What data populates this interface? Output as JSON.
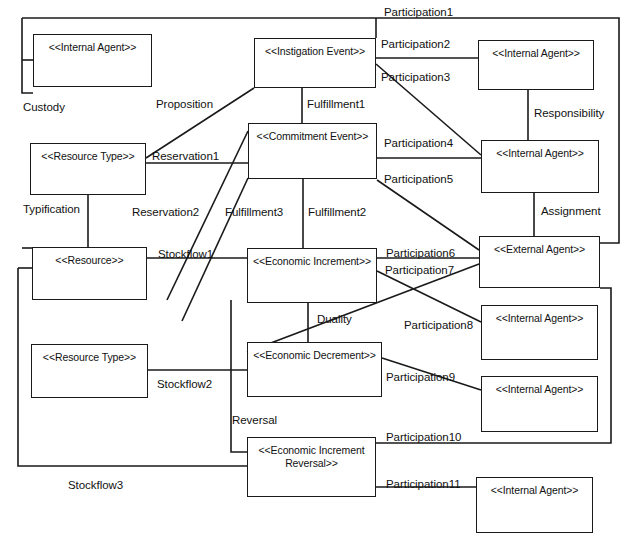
{
  "diagram": {
    "width": 638,
    "height": 548,
    "background": "#ffffff",
    "stroke": "#1a1a1a",
    "text_color": "#111111",
    "nodes": [
      {
        "id": "internal_agent_1",
        "label": "<<Internal Agent>>",
        "x": 33,
        "y": 34,
        "w": 119,
        "h": 53
      },
      {
        "id": "instigation_event",
        "label": "<<Instigation Event>>",
        "x": 254,
        "y": 38,
        "w": 122,
        "h": 50
      },
      {
        "id": "internal_agent_2",
        "label": "<<Internal Agent>>",
        "x": 478,
        "y": 40,
        "w": 116,
        "h": 50
      },
      {
        "id": "commitment_event",
        "label": "<<Commitment Event>>",
        "x": 248,
        "y": 123,
        "w": 129,
        "h": 56
      },
      {
        "id": "resource_type_1",
        "label": "<<Resource Type>>",
        "x": 30,
        "y": 143,
        "w": 116,
        "h": 52
      },
      {
        "id": "internal_agent_3",
        "label": "<<Internal Agent>>",
        "x": 481,
        "y": 140,
        "w": 118,
        "h": 53
      },
      {
        "id": "resource",
        "label": "<<Resource>>",
        "x": 32,
        "y": 247,
        "w": 115,
        "h": 53
      },
      {
        "id": "economic_increment",
        "label": "<<Economic Increment>>",
        "x": 247,
        "y": 248,
        "w": 130,
        "h": 55
      },
      {
        "id": "external_agent",
        "label": "<<External Agent>>",
        "x": 479,
        "y": 236,
        "w": 121,
        "h": 52
      },
      {
        "id": "internal_agent_4",
        "label": "<<Internal Agent>>",
        "x": 481,
        "y": 305,
        "w": 117,
        "h": 55
      },
      {
        "id": "resource_type_2",
        "label": "<<Resource Type>>",
        "x": 31,
        "y": 344,
        "w": 117,
        "h": 54
      },
      {
        "id": "economic_decrement",
        "label": "<<Economic Decrement>>",
        "x": 247,
        "y": 342,
        "w": 135,
        "h": 55
      },
      {
        "id": "internal_agent_5",
        "label": "<<Internal Agent>>",
        "x": 481,
        "y": 376,
        "w": 117,
        "h": 56
      },
      {
        "id": "economic_increment_reversal",
        "label": "<<Economic Increment\nReversal>>",
        "x": 247,
        "y": 437,
        "w": 129,
        "h": 60
      },
      {
        "id": "internal_agent_6",
        "label": "<<Internal Agent>>",
        "x": 476,
        "y": 477,
        "w": 117,
        "h": 56
      }
    ],
    "edge_labels": [
      {
        "id": "participation1",
        "text": "Participation1",
        "x": 384,
        "y": 6
      },
      {
        "id": "participation2",
        "text": "Participation2",
        "x": 381,
        "y": 38
      },
      {
        "id": "participation3",
        "text": "Participation3",
        "x": 381,
        "y": 71
      },
      {
        "id": "custody",
        "text": "Custody",
        "x": 23,
        "y": 101
      },
      {
        "id": "proposition",
        "text": "Proposition",
        "x": 156,
        "y": 98
      },
      {
        "id": "fulfillment1",
        "text": "Fulfillment1",
        "x": 307,
        "y": 98
      },
      {
        "id": "responsibility",
        "text": "Responsibility",
        "x": 534,
        "y": 107
      },
      {
        "id": "reservation1",
        "text": "Reservation1",
        "x": 152,
        "y": 150
      },
      {
        "id": "participation4",
        "text": "Participation4",
        "x": 384,
        "y": 137
      },
      {
        "id": "participation5",
        "text": "Participation5",
        "x": 384,
        "y": 173
      },
      {
        "id": "typification",
        "text": "Typification",
        "x": 23,
        "y": 203
      },
      {
        "id": "reservation2",
        "text": "Reservation2",
        "x": 132,
        "y": 206
      },
      {
        "id": "fulfillment3",
        "text": "Fulfillment3",
        "x": 225,
        "y": 206
      },
      {
        "id": "fulfillment2",
        "text": "Fulfillment2",
        "x": 308,
        "y": 206
      },
      {
        "id": "assignment",
        "text": "Assignment",
        "x": 541,
        "y": 205
      },
      {
        "id": "stockflow1",
        "text": "Stockflow1",
        "x": 158,
        "y": 248
      },
      {
        "id": "participation6",
        "text": "Participation6",
        "x": 386,
        "y": 247
      },
      {
        "id": "participation7",
        "text": "Participation7",
        "x": 385,
        "y": 264
      },
      {
        "id": "duality",
        "text": "Duality",
        "x": 317,
        "y": 313
      },
      {
        "id": "participation8",
        "text": "Participation8",
        "x": 404,
        "y": 319
      },
      {
        "id": "participation9",
        "text": "Participation9",
        "x": 386,
        "y": 371
      },
      {
        "id": "stockflow2",
        "text": "Stockflow2",
        "x": 157,
        "y": 378
      },
      {
        "id": "reversal",
        "text": "Reversal",
        "x": 232,
        "y": 414
      },
      {
        "id": "participation10",
        "text": "Participation10",
        "x": 386,
        "y": 431
      },
      {
        "id": "stockflow3",
        "text": "Stockflow3",
        "x": 68,
        "y": 479
      },
      {
        "id": "participation11",
        "text": "Participation11",
        "x": 386,
        "y": 478
      }
    ],
    "connectors": [
      {
        "id": "custody-line",
        "points": "22,18 22,93 33,93"
      },
      {
        "id": "custody-top",
        "points": "22,18 376,18"
      },
      {
        "id": "participation1-line",
        "points": "376,18 376,38"
      },
      {
        "id": "participation1-right",
        "points": "376,18 619,18 619,243 600,243"
      },
      {
        "id": "custody-ia1",
        "points": "22,60 33,60"
      },
      {
        "id": "proposition-line",
        "points": "146,158 254,88"
      },
      {
        "id": "participation2-line",
        "points": "376,58 478,58"
      },
      {
        "id": "participation3-line",
        "points": "376,64 481,155"
      },
      {
        "id": "fulfillment1-line",
        "points": "302,88 302,123"
      },
      {
        "id": "responsibility-line",
        "points": "528,90 528,140"
      },
      {
        "id": "reservation1-line",
        "points": "146,163 248,163"
      },
      {
        "id": "participation4-line",
        "points": "377,158 481,158"
      },
      {
        "id": "participation5-line",
        "points": "377,180 479,250"
      },
      {
        "id": "typification-line",
        "points": "88,195 88,247"
      },
      {
        "id": "custody-res",
        "points": "22,248 32,248"
      },
      {
        "id": "reservation2-line",
        "points": "167,300 248,131"
      },
      {
        "id": "fulfillment3-line",
        "points": "182,321 248,178"
      },
      {
        "id": "fulfillment2-line",
        "points": "303,179 303,248"
      },
      {
        "id": "assignment-line",
        "points": "534,193 534,236"
      },
      {
        "id": "stockflow1-line",
        "points": "147,258 247,258"
      },
      {
        "id": "participation6-line",
        "points": "377,258 479,258"
      },
      {
        "id": "participation7-line",
        "points": "377,271 481,322"
      },
      {
        "id": "duality-line",
        "points": "308,303 308,342"
      },
      {
        "id": "participation8-line",
        "points": "247,352 479,264"
      },
      {
        "id": "participation9-line",
        "points": "382,358 481,390"
      },
      {
        "id": "stockflow2-line",
        "points": "148,370 247,370"
      },
      {
        "id": "reversal-line",
        "points": "231,300 231,452 247,452"
      },
      {
        "id": "participation10-line",
        "points": "376,443 611,443 611,288 600,288"
      },
      {
        "id": "participation11-line",
        "points": "376,487 476,487"
      },
      {
        "id": "stockflow3-line",
        "points": "18,268 18,466 247,466"
      },
      {
        "id": "stockflow3-res",
        "points": "18,268 32,268"
      }
    ]
  }
}
